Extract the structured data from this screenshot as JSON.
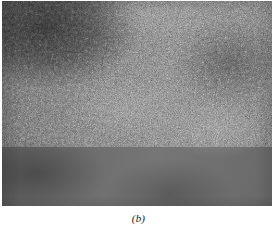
{
  "figure": {
    "panel_label": "(b)",
    "media_type": "grayscale-micrograph",
    "alt_description": "Fine-grained speckled grayscale micrograph with a darker region in the upper-left corner",
    "colors": {
      "page_background": "#ffffff",
      "plate_base_gray": "#6f6f6f",
      "caption_text": "#1a1a1a"
    },
    "plate": {
      "left": 2,
      "top": 1,
      "width": 270,
      "height": 205
    }
  }
}
